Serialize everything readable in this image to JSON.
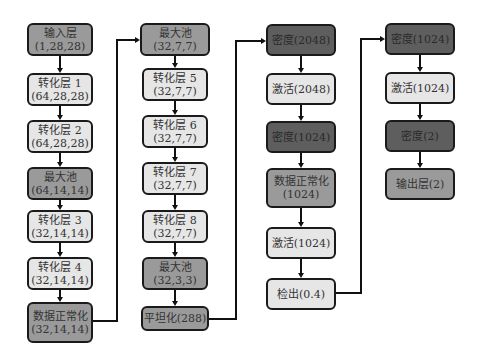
{
  "columns": [
    {
      "nodes": [
        {
          "line1": "输入层",
          "line2": "(1,28,28)",
          "shade": "mid"
        },
        {
          "line1": "转化层 1",
          "line2": "(64,28,28)",
          "shade": "light"
        },
        {
          "line1": "转化层 2",
          "line2": "(64,28,28)",
          "shade": "light"
        },
        {
          "line1": "最大池",
          "line2": "(64,14,14)",
          "shade": "mid"
        },
        {
          "line1": "转化层 3",
          "line2": "(32,14,14)",
          "shade": "light"
        },
        {
          "line1": "转化层 4",
          "line2": "(32,14,14)",
          "shade": "light"
        },
        {
          "line1": "数据正常化",
          "line2": "(32,14,14)",
          "shade": "mid"
        }
      ]
    },
    {
      "nodes": [
        {
          "line1": "最大池",
          "line2": "(32,7,7)",
          "shade": "mid"
        },
        {
          "line1": "转化层 5",
          "line2": "(32,7,7)",
          "shade": "light"
        },
        {
          "line1": "转化层 6",
          "line2": "(32,7,7)",
          "shade": "light"
        },
        {
          "line1": "转化层 7",
          "line2": "(32,7,7)",
          "shade": "light"
        },
        {
          "line1": "转化层 8",
          "line2": "(32,7,7)",
          "shade": "light"
        },
        {
          "line1": "最大池",
          "line2": "(32,3,3)",
          "shade": "mid"
        },
        {
          "line1": "平坦化(288)",
          "line2": "",
          "shade": "mid"
        }
      ]
    },
    {
      "nodes": [
        {
          "line1": "密度(2048)",
          "line2": "",
          "shade": "dark"
        },
        {
          "line1": "激活(2048)",
          "line2": "",
          "shade": "light"
        },
        {
          "line1": "密度(1024)",
          "line2": "",
          "shade": "dark"
        },
        {
          "line1": "数据正常化",
          "line2": "(1024)",
          "shade": "mid"
        },
        {
          "line1": "激活(1024)",
          "line2": "",
          "shade": "light"
        },
        {
          "line1": "检出(0.4)",
          "line2": "",
          "shade": "light"
        }
      ]
    },
    {
      "nodes": [
        {
          "line1": "密度(1024)",
          "line2": "",
          "shade": "dark"
        },
        {
          "line1": "激活(1024)",
          "line2": "",
          "shade": "light"
        },
        {
          "line1": "密度(2)",
          "line2": "",
          "shade": "dark"
        },
        {
          "line1": "输出层(2)",
          "line2": "",
          "shade": "mid"
        }
      ]
    }
  ],
  "colors": {
    "light": "#e6e6e6",
    "mid": "#9a9a9a",
    "dark": "#5e5e5e",
    "border": "#1a1a1a"
  }
}
